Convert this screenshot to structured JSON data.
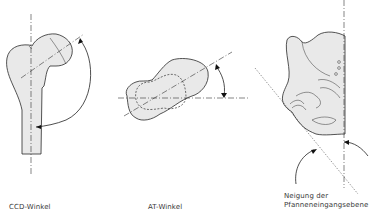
{
  "diagram": {
    "panels": [
      {
        "id": "ccd",
        "label": "CCD-Winkel",
        "subject": "proximal femur, frontal view"
      },
      {
        "id": "at",
        "label": "AT-Winkel",
        "subject": "femoral head/neck, axial view"
      },
      {
        "id": "pelvis",
        "label_line1": "Neigung der",
        "label_line2": "Pfanneneingangsebene",
        "subject": "hemipelvis/acetabulum"
      }
    ],
    "colors": {
      "fill": "#e9e9e9",
      "stroke": "#2a2a2a",
      "background": "#ffffff"
    }
  }
}
